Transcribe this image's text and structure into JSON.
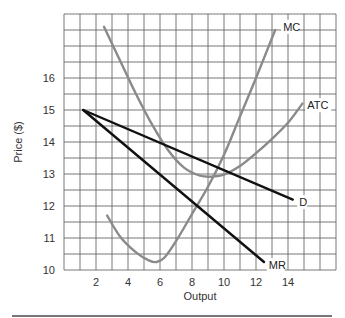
{
  "chart_data": {
    "type": "line",
    "title": "",
    "xlabel": "Output",
    "ylabel": "Price ($)",
    "xlim": [
      0,
      17
    ],
    "ylim": [
      10,
      18
    ],
    "grid": true,
    "grid_step_x": 1,
    "grid_step_y": 0.5,
    "x_ticks": [
      2,
      4,
      6,
      8,
      10,
      12,
      14
    ],
    "y_ticks": [
      10,
      11,
      12,
      13,
      14,
      15,
      16
    ],
    "series": [
      {
        "name": "MC",
        "color": "#8a8a8a",
        "width": 2.4,
        "label_pos": [
          13.7,
          17.6
        ],
        "points": [
          [
            2.7,
            11.7
          ],
          [
            3.5,
            11.05
          ],
          [
            4.5,
            10.55
          ],
          [
            5.3,
            10.3
          ],
          [
            5.8,
            10.25
          ],
          [
            6.3,
            10.4
          ],
          [
            7.0,
            10.9
          ],
          [
            8.0,
            11.75
          ],
          [
            9.0,
            12.6
          ],
          [
            10.0,
            13.6
          ],
          [
            11.0,
            14.8
          ],
          [
            12.0,
            16.0
          ],
          [
            13.2,
            17.5
          ]
        ]
      },
      {
        "name": "ATC",
        "color": "#8a8a8a",
        "width": 2.4,
        "label_pos": [
          15.2,
          15.15
        ],
        "points": [
          [
            2.5,
            17.6
          ],
          [
            3.5,
            16.55
          ],
          [
            4.5,
            15.5
          ],
          [
            5.5,
            14.55
          ],
          [
            6.5,
            13.75
          ],
          [
            7.5,
            13.2
          ],
          [
            8.5,
            12.95
          ],
          [
            9.3,
            12.92
          ],
          [
            10.0,
            12.98
          ],
          [
            11.0,
            13.25
          ],
          [
            12.0,
            13.65
          ],
          [
            13.0,
            14.1
          ],
          [
            14.0,
            14.6
          ],
          [
            14.9,
            15.2
          ]
        ]
      },
      {
        "name": "D",
        "color": "#111111",
        "width": 2.4,
        "label_pos": [
          14.7,
          12.12
        ],
        "points": [
          [
            1.2,
            15.0
          ],
          [
            14.3,
            12.2
          ]
        ]
      },
      {
        "name": "MR",
        "color": "#111111",
        "width": 2.4,
        "label_pos": [
          12.8,
          10.15
        ],
        "points": [
          [
            1.2,
            15.0
          ],
          [
            12.5,
            10.25
          ]
        ]
      }
    ]
  }
}
